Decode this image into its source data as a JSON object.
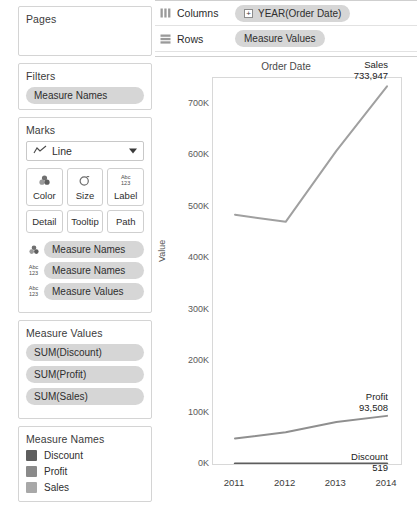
{
  "sidebar": {
    "pages": {
      "title": "Pages"
    },
    "filters": {
      "title": "Filters",
      "pills": [
        {
          "label": "Measure Names"
        }
      ]
    },
    "marks": {
      "title": "Marks",
      "mark_type": "Line",
      "mark_type_icon": "line-chart-icon",
      "buttons": [
        {
          "label": "Color",
          "icon": "color-palette-icon"
        },
        {
          "label": "Size",
          "icon": "size-circle-icon"
        },
        {
          "label": "Label",
          "icon": "abc-123-icon"
        },
        {
          "label": "Detail",
          "icon": ""
        },
        {
          "label": "Tooltip",
          "icon": ""
        },
        {
          "label": "Path",
          "icon": ""
        }
      ],
      "pills": [
        {
          "label": "Measure Names",
          "icon": "color-palette-icon"
        },
        {
          "label": "Measure Names",
          "icon": "abc-123-icon"
        },
        {
          "label": "Measure Values",
          "icon": "abc-123-icon"
        }
      ]
    },
    "measure_values": {
      "title": "Measure Values",
      "pills": [
        {
          "label": "SUM(Discount)"
        },
        {
          "label": "SUM(Profit)"
        },
        {
          "label": "SUM(Sales)"
        }
      ]
    },
    "measure_names": {
      "title": "Measure Names",
      "items": [
        {
          "label": "Discount",
          "color": "#5e5e5e"
        },
        {
          "label": "Profit",
          "color": "#8a8a8a"
        },
        {
          "label": "Sales",
          "color": "#a8a8a8"
        }
      ]
    }
  },
  "shelves": {
    "columns": {
      "label": "Columns",
      "icon": "columns-grid-icon",
      "pill": "YEAR(Order Date)",
      "pill_has_plus": true
    },
    "rows": {
      "label": "Rows",
      "icon": "rows-grid-icon",
      "pill": "Measure Values",
      "pill_has_plus": false
    }
  },
  "chart_data": {
    "type": "line",
    "title": "Order Date",
    "xlabel": "",
    "ylabel": "Value",
    "x": [
      "2011",
      "2012",
      "2013",
      "2014"
    ],
    "ylim": [
      0,
      750000
    ],
    "yticks": [
      0,
      100000,
      200000,
      300000,
      400000,
      500000,
      600000,
      700000
    ],
    "ytick_labels": [
      "0K",
      "100K",
      "200K",
      "300K",
      "400K",
      "500K",
      "600K",
      "700K"
    ],
    "grid": false,
    "legend": "none",
    "series": [
      {
        "name": "Sales",
        "color": "#a0a0a0",
        "values": [
          484247,
          470533,
          608474,
          733947
        ],
        "end_label_name": "Sales",
        "end_label_value": "733,947"
      },
      {
        "name": "Profit",
        "color": "#8f8f8f",
        "values": [
          49544,
          61619,
          81795,
          93508
        ],
        "end_label_name": "Profit",
        "end_label_value": "93,508"
      },
      {
        "name": "Discount",
        "color": "#5d5d5d",
        "values": [
          519,
          519,
          519,
          519
        ],
        "end_label_name": "Discount",
        "end_label_value": "519"
      }
    ]
  }
}
